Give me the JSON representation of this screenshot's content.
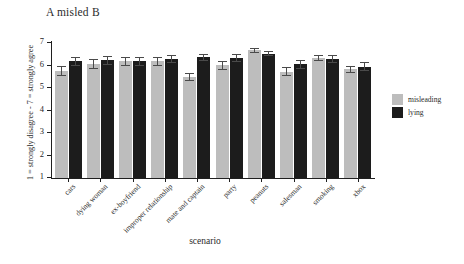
{
  "chart_data": {
    "type": "bar",
    "title": "A misled B",
    "xlabel": "scenario",
    "ylabel": "1 = strongly disagree - 7 = strongly agree",
    "ylim": [
      1,
      7
    ],
    "yticks": [
      7,
      6,
      5,
      4,
      3,
      2,
      1
    ],
    "grid": false,
    "legend_position": "right",
    "categories": [
      "cars",
      "dying woman",
      "ex-boyfriend",
      "improper relationship",
      "mate and captain",
      "party",
      "peanuts",
      "salesman",
      "smoking",
      "xbox"
    ],
    "series": [
      {
        "name": "misleading",
        "color": "#bdbdbd",
        "values": [
          5.75,
          6.07,
          6.18,
          6.18,
          5.48,
          6.02,
          6.68,
          5.73,
          6.33,
          5.83
        ],
        "errors": [
          0.23,
          0.22,
          0.22,
          0.2,
          0.18,
          0.2,
          0.12,
          0.2,
          0.15,
          0.17
        ]
      },
      {
        "name": "lying",
        "color": "#1c1c1c",
        "values": [
          6.18,
          6.23,
          6.18,
          6.3,
          6.37,
          6.32,
          6.53,
          6.05,
          6.3,
          5.95
        ],
        "errors": [
          0.18,
          0.2,
          0.2,
          0.17,
          0.15,
          0.17,
          0.12,
          0.2,
          0.17,
          0.2
        ]
      }
    ]
  },
  "legend": {
    "items": [
      {
        "label": "misleading",
        "key": "misleading"
      },
      {
        "label": "lying",
        "key": "lying"
      }
    ]
  }
}
